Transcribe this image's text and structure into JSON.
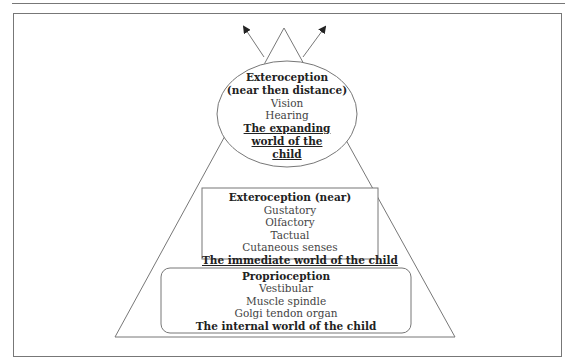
{
  "diagram": {
    "type": "pyramid-hierarchy",
    "arrows": [
      "up-left",
      "up-right"
    ],
    "top_ellipse": {
      "title_lines": [
        "Exteroception",
        "(near then distance)"
      ],
      "items": [
        "Vision",
        "Hearing"
      ],
      "summary_lines": [
        "The expanding",
        "world of the",
        "child"
      ]
    },
    "middle_box": {
      "title": "Exteroception (near)",
      "items": [
        "Gustatory",
        "Olfactory",
        "Tactual",
        "Cutaneous senses"
      ],
      "summary": "The immediate world of the child"
    },
    "bottom_box": {
      "title": "Proprioception",
      "items": [
        "Vestibular",
        "Muscle spindle",
        "Golgi tendon organ"
      ],
      "summary": "The internal world of the child"
    },
    "colors": {
      "line": "#777777",
      "text": "#333333",
      "background": "#ffffff"
    }
  }
}
